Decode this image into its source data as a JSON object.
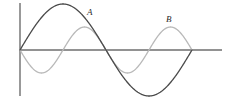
{
  "figure": {
    "width": 228,
    "height": 99,
    "background": "#ffffff"
  },
  "axes": {
    "origin_x": 20,
    "origin_y": 50,
    "x_axis": {
      "x_start": 20,
      "x_end": 222,
      "y": 50,
      "color": "#6e6e6e",
      "width": 1.4
    },
    "y_axis": {
      "x": 20,
      "y_start": 3,
      "y_end": 96,
      "color": "#6e6e6e",
      "width": 1.4
    }
  },
  "labels": {
    "curve_a": "A",
    "curve_b": "B"
  },
  "chart_data": {
    "type": "line",
    "title": "",
    "xlabel": "",
    "ylabel": "",
    "grid": false,
    "legend": "inline-labels",
    "xlim": [
      0,
      1
    ],
    "ylim": [
      -1,
      1
    ],
    "series": [
      {
        "name": "A",
        "label": "A",
        "color": "#4a4a4a",
        "linewidth": 1.3,
        "description": "One full sine cycle: positive hump then negative hump",
        "amplitude_px": 46,
        "period_px": 172,
        "phase": "sin",
        "x_start_px": 20,
        "x_end_px": 192,
        "peak_px": {
          "x": 63,
          "y": 4
        },
        "trough_px": {
          "x": 156,
          "y": 95
        },
        "zero_crossings_px": [
          20,
          106,
          192
        ]
      },
      {
        "name": "B",
        "label": "B",
        "color": "#b9b9b9",
        "linewidth": 1.3,
        "description": "Two inverted half-cycles: negative hump, positive hump, negative hump, positive hump at half amplitude and half period",
        "amplitude_px": 23,
        "period_px": 86,
        "phase": "-sin",
        "x_start_px": 20,
        "x_end_px": 192,
        "peak_px": [
          {
            "x": 77,
            "y": 27
          },
          {
            "x": 170,
            "y": 27
          }
        ],
        "trough_px": [
          {
            "x": 42,
            "y": 73
          },
          {
            "x": 127,
            "y": 73
          }
        ],
        "zero_crossings_px": [
          20,
          63,
          106,
          149,
          192
        ]
      }
    ]
  }
}
